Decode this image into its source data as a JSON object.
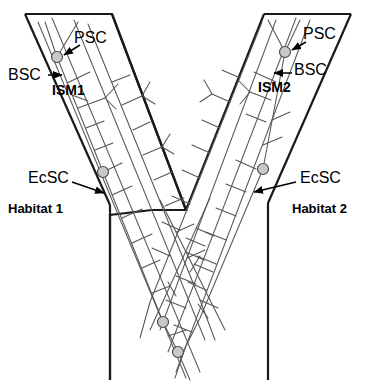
{
  "figure": {
    "type": "schematic-diagram",
    "background_color": "#ffffff",
    "outline_color": "#1a1a1a",
    "filament_color": "#555555",
    "node_fill_color": "#c9c9c9",
    "node_stroke_color": "#4d4d4d"
  },
  "labels": {
    "psc_left": "PSC",
    "psc_right": "PSC",
    "bsc_left": "BSC",
    "bsc_right": "BSC",
    "ism_left": "ISM1",
    "ism_right": "ISM2",
    "ecsc_left": "EcSC",
    "ecsc_right": "EcSC",
    "habitat_left": "Habitat 1",
    "habitat_right": "Habitat 2"
  },
  "nodes": [
    {
      "name": "psc-node-left",
      "label": "PSC",
      "cx": 57,
      "cy": 57,
      "r": 5.5
    },
    {
      "name": "psc-node-right",
      "label": "PSC",
      "cx": 285,
      "cy": 52,
      "r": 5.5
    },
    {
      "name": "ecsc-node-left",
      "label": "EcSC",
      "cx": 103,
      "cy": 172,
      "r": 5.5
    },
    {
      "name": "ecsc-node-right",
      "label": "EcSC",
      "cx": 263,
      "cy": 169,
      "r": 5.5
    },
    {
      "name": "bottom-node-upper",
      "label": "",
      "cx": 163,
      "cy": 322,
      "r": 5.5
    },
    {
      "name": "bottom-node-lower",
      "label": "",
      "cx": 178,
      "cy": 352,
      "r": 5.5
    }
  ]
}
